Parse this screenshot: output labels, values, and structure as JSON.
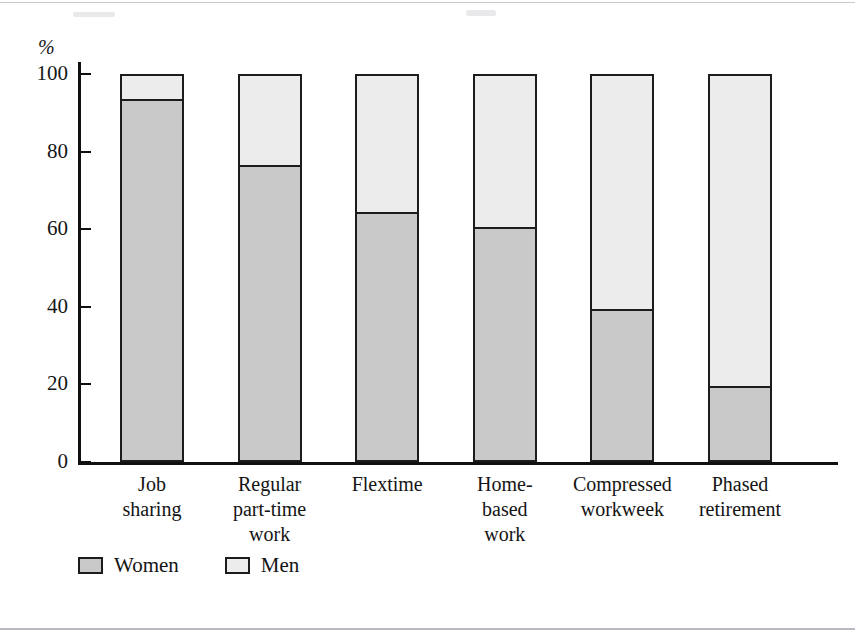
{
  "figure": {
    "yaxis_unit_label": "%",
    "legend_position": "bottom-left"
  },
  "axis": {
    "ticks": [
      "100",
      "80",
      "60",
      "40",
      "20",
      "0"
    ]
  },
  "legend": {
    "items": [
      {
        "label": "Women",
        "swatch": "women-swatch",
        "color": "#c9c9c9"
      },
      {
        "label": "Men",
        "swatch": "men-swatch",
        "color": "#ececec"
      }
    ]
  },
  "categories": [
    {
      "line1": "Job",
      "line2": "sharing",
      "line3": ""
    },
    {
      "line1": "Regular",
      "line2": "part-time",
      "line3": "work"
    },
    {
      "line1": "Flextime",
      "line2": "",
      "line3": ""
    },
    {
      "line1": "Home-",
      "line2": "based",
      "line3": "work"
    },
    {
      "line1": "Compressed",
      "line2": "workweek",
      "line3": ""
    },
    {
      "line1": "Phased",
      "line2": "retirement",
      "line3": ""
    }
  ],
  "chart_data": {
    "type": "bar",
    "title": "",
    "xlabel": "",
    "ylabel": "%",
    "ylim": [
      0,
      100
    ],
    "yticks": [
      0,
      20,
      40,
      60,
      80,
      100
    ],
    "grid": false,
    "stacked": true,
    "legend": [
      "Women",
      "Men"
    ],
    "categories": [
      "Job sharing",
      "Regular part-time work",
      "Flextime",
      "Home-based work",
      "Compressed workweek",
      "Phased retirement"
    ],
    "series": [
      {
        "name": "Women",
        "color": "#c9c9c9",
        "values": [
          93,
          76,
          64,
          60,
          39,
          19
        ]
      },
      {
        "name": "Men",
        "color": "#ececec",
        "values": [
          7,
          24,
          36,
          40,
          61,
          81
        ]
      }
    ]
  }
}
